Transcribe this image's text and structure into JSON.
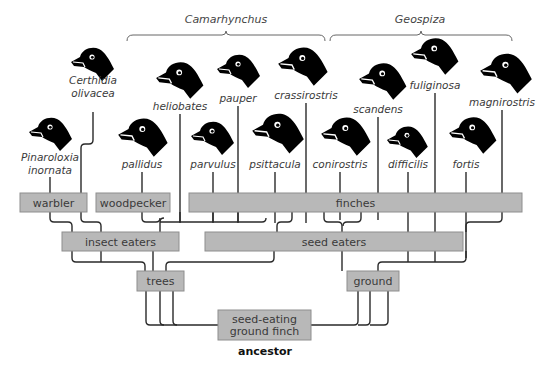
{
  "genera": [
    {
      "id": "camarhynchus",
      "label": "Camarhynchus",
      "x1": 127,
      "x2": 325,
      "y": 35,
      "label_x": 226,
      "label_y": 23
    },
    {
      "id": "geospiza",
      "label": "Geospiza",
      "x1": 330,
      "x2": 512,
      "y": 35,
      "label_x": 420,
      "label_y": 23
    }
  ],
  "species": [
    {
      "id": "pinaroloxia",
      "label_lines": [
        "Pinaroloxia",
        "inornata"
      ],
      "line_x": 50,
      "label_y": 167,
      "head": {
        "x": 48,
        "y": 133,
        "s": 1.0
      }
    },
    {
      "id": "certhidia",
      "label_lines": [
        "Certhidia",
        "olivacea"
      ],
      "line_x": 93,
      "label_y": 90,
      "head": {
        "x": 90,
        "y": 63,
        "s": 1.0
      }
    },
    {
      "id": "pallidus",
      "label_lines": [
        "pallidus"
      ],
      "line_x": 142,
      "label_y": 168,
      "head": {
        "x": 140,
        "y": 136,
        "s": 1.15
      }
    },
    {
      "id": "heliobates",
      "label_lines": [
        "heliobates"
      ],
      "line_x": 180,
      "label_y": 110,
      "head": {
        "x": 177,
        "y": 79,
        "s": 1.1
      }
    },
    {
      "id": "parvulus",
      "label_lines": [
        "parvulus"
      ],
      "line_x": 213,
      "label_y": 168,
      "head": {
        "x": 210,
        "y": 137,
        "s": 1.0
      }
    },
    {
      "id": "pauper",
      "label_lines": [
        "pauper"
      ],
      "line_x": 238,
      "label_y": 102,
      "head": {
        "x": 236,
        "y": 70,
        "s": 1.0
      }
    },
    {
      "id": "psittacula",
      "label_lines": [
        "psittacula"
      ],
      "line_x": 275,
      "label_y": 168,
      "head": {
        "x": 275,
        "y": 132,
        "s": 1.2
      }
    },
    {
      "id": "crassirostris",
      "label_lines": [
        "crassirostris"
      ],
      "line_x": 306,
      "label_y": 99,
      "head": {
        "x": 300,
        "y": 65,
        "s": 1.15
      }
    },
    {
      "id": "conirostris",
      "label_lines": [
        "conirostris"
      ],
      "line_x": 340,
      "label_y": 168,
      "head": {
        "x": 343,
        "y": 135,
        "s": 1.15
      }
    },
    {
      "id": "scandens",
      "label_lines": [
        "scandens"
      ],
      "line_x": 378,
      "label_y": 113,
      "head": {
        "x": 380,
        "y": 80,
        "s": 1.1
      }
    },
    {
      "id": "difficilis",
      "label_lines": [
        "difficilis"
      ],
      "line_x": 408,
      "label_y": 168,
      "head": {
        "x": 405,
        "y": 141,
        "s": 0.95
      }
    },
    {
      "id": "fuliginosa",
      "label_lines": [
        "fuliginosa"
      ],
      "line_x": 435,
      "label_y": 89,
      "head": {
        "x": 432,
        "y": 55,
        "s": 1.1
      }
    },
    {
      "id": "fortis",
      "label_lines": [
        "fortis"
      ],
      "line_x": 466,
      "label_y": 168,
      "head": {
        "x": 470,
        "y": 134,
        "s": 1.1
      }
    },
    {
      "id": "magnirostris",
      "label_lines": [
        "magnirostris"
      ],
      "line_x": 502,
      "label_y": 106,
      "head": {
        "x": 503,
        "y": 72,
        "s": 1.2
      }
    }
  ],
  "boxes": [
    {
      "id": "warbler",
      "label_lines": [
        "warbler"
      ],
      "x": 20,
      "y": 193,
      "w": 67,
      "h": 19
    },
    {
      "id": "woodpecker",
      "label_lines": [
        "woodpecker"
      ],
      "x": 96,
      "y": 193,
      "w": 74,
      "h": 19
    },
    {
      "id": "finches",
      "label_lines": [
        "finches"
      ],
      "x": 189,
      "y": 193,
      "w": 333,
      "h": 19
    },
    {
      "id": "insect-eaters",
      "label_lines": [
        "insect eaters"
      ],
      "x": 62,
      "y": 232,
      "w": 117,
      "h": 19
    },
    {
      "id": "seed-eaters",
      "label_lines": [
        "seed eaters"
      ],
      "x": 205,
      "y": 232,
      "w": 258,
      "h": 19
    },
    {
      "id": "trees",
      "label_lines": [
        "trees"
      ],
      "x": 137,
      "y": 271,
      "w": 47,
      "h": 20
    },
    {
      "id": "ground",
      "label_lines": [
        "ground"
      ],
      "x": 347,
      "y": 271,
      "w": 52,
      "h": 20
    },
    {
      "id": "ancestor-box",
      "label_lines": [
        "seed-eating",
        "ground finch"
      ],
      "x": 218,
      "y": 310,
      "w": 93,
      "h": 30
    }
  ],
  "ancestor_label": {
    "text": "ancestor",
    "x": 265,
    "y": 355
  },
  "colors": {
    "box_fill": "#b8b8b8",
    "box_stroke": "#8e8e8e",
    "line": "#2a2a2a",
    "bird": "#000000"
  }
}
